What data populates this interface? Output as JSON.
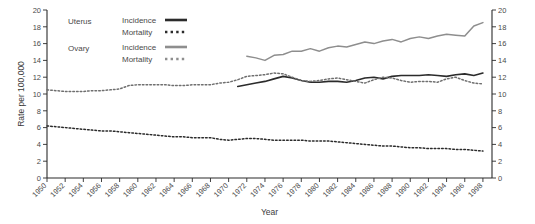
{
  "chart_data": {
    "type": "line",
    "title": "",
    "xlabel": "Year",
    "ylabel": "Rate per 100,000",
    "xlim": [
      1950,
      1999
    ],
    "ylim": [
      0,
      20
    ],
    "ytick_step": 2,
    "xtick_step": 2,
    "grid": false,
    "legend_position": "top-left-inside",
    "yticks": [
      "0",
      "2",
      "4",
      "6",
      "8",
      "10",
      "12",
      "14",
      "16",
      "18",
      "20"
    ],
    "right_axis_yticks": [
      "0",
      "2",
      "4",
      "6",
      "8",
      "10",
      "12",
      "14",
      "16",
      "18",
      "20"
    ],
    "xticks": [
      "1950",
      "1952",
      "1954",
      "1956",
      "1958",
      "1960",
      "1962",
      "1964",
      "1966",
      "1968",
      "1970",
      "1972",
      "1974",
      "1976",
      "1978",
      "1980",
      "1982",
      "1984",
      "1986",
      "1988",
      "1990",
      "1992",
      "1994",
      "1996",
      "1998"
    ],
    "legend": {
      "groups": [
        {
          "name": "Uterus",
          "color": "#2b2b2b",
          "entries": [
            {
              "label": "Incidence",
              "style": "solid"
            },
            {
              "label": "Mortality",
              "style": "dotted"
            }
          ]
        },
        {
          "name": "Ovary",
          "color": "#8e8e8e",
          "entries": [
            {
              "label": "Incidence",
              "style": "solid"
            },
            {
              "label": "Mortality",
              "style": "dotted"
            }
          ]
        }
      ]
    },
    "series": [
      {
        "name": "Uterus Incidence",
        "group": "Uterus",
        "style": "solid",
        "color": "#2b2b2b",
        "width": 1.6,
        "x": [
          1971,
          1972,
          1973,
          1974,
          1975,
          1976,
          1977,
          1978,
          1979,
          1980,
          1981,
          1982,
          1983,
          1984,
          1985,
          1986,
          1987,
          1988,
          1989,
          1990,
          1991,
          1992,
          1993,
          1994,
          1995,
          1996,
          1997,
          1998
        ],
        "values": [
          10.9,
          11.1,
          11.3,
          11.5,
          11.8,
          12.1,
          11.9,
          11.6,
          11.4,
          11.4,
          11.5,
          11.5,
          11.4,
          11.6,
          11.9,
          12.0,
          11.8,
          12.1,
          12.2,
          12.2,
          12.2,
          12.3,
          12.2,
          12.1,
          12.3,
          12.4,
          12.2,
          12.5
        ]
      },
      {
        "name": "Uterus Mortality",
        "group": "Uterus",
        "style": "dotted",
        "color": "#2b2b2b",
        "width": 1.5,
        "x": [
          1950,
          1951,
          1952,
          1953,
          1954,
          1955,
          1956,
          1957,
          1958,
          1959,
          1960,
          1961,
          1962,
          1963,
          1964,
          1965,
          1966,
          1967,
          1968,
          1969,
          1970,
          1971,
          1972,
          1973,
          1974,
          1975,
          1976,
          1977,
          1978,
          1979,
          1980,
          1981,
          1982,
          1983,
          1984,
          1985,
          1986,
          1987,
          1988,
          1989,
          1990,
          1991,
          1992,
          1993,
          1994,
          1995,
          1996,
          1997,
          1998
        ],
        "values": [
          6.2,
          6.1,
          6.0,
          5.9,
          5.8,
          5.7,
          5.6,
          5.6,
          5.5,
          5.4,
          5.3,
          5.2,
          5.1,
          5.0,
          4.9,
          4.9,
          4.8,
          4.8,
          4.8,
          4.6,
          4.5,
          4.6,
          4.7,
          4.7,
          4.6,
          4.5,
          4.5,
          4.5,
          4.5,
          4.4,
          4.4,
          4.4,
          4.3,
          4.2,
          4.1,
          4.0,
          3.9,
          3.8,
          3.8,
          3.7,
          3.6,
          3.6,
          3.5,
          3.5,
          3.5,
          3.4,
          3.4,
          3.3,
          3.2
        ]
      },
      {
        "name": "Ovary Incidence",
        "group": "Ovary",
        "style": "solid",
        "color": "#8e8e8e",
        "width": 1.5,
        "x": [
          1972,
          1973,
          1974,
          1975,
          1976,
          1977,
          1978,
          1979,
          1980,
          1981,
          1982,
          1983,
          1984,
          1985,
          1986,
          1987,
          1988,
          1989,
          1990,
          1991,
          1992,
          1993,
          1994,
          1995,
          1996,
          1997,
          1998
        ],
        "values": [
          14.5,
          14.3,
          14.0,
          14.6,
          14.7,
          15.1,
          15.1,
          15.4,
          15.1,
          15.5,
          15.7,
          15.6,
          15.9,
          16.2,
          16.0,
          16.3,
          16.5,
          16.2,
          16.6,
          16.8,
          16.6,
          16.9,
          17.1,
          17.0,
          16.9,
          18.1,
          18.5
        ]
      },
      {
        "name": "Ovary Mortality",
        "group": "Ovary",
        "style": "dotted",
        "color": "#6f6f6f",
        "width": 1.5,
        "x": [
          1950,
          1951,
          1952,
          1953,
          1954,
          1955,
          1956,
          1957,
          1958,
          1959,
          1960,
          1961,
          1962,
          1963,
          1964,
          1965,
          1966,
          1967,
          1968,
          1969,
          1970,
          1971,
          1972,
          1973,
          1974,
          1975,
          1976,
          1977,
          1978,
          1979,
          1980,
          1981,
          1982,
          1983,
          1984,
          1985,
          1986,
          1987,
          1988,
          1989,
          1990,
          1991,
          1992,
          1993,
          1994,
          1995,
          1996,
          1997,
          1998
        ],
        "values": [
          10.5,
          10.4,
          10.3,
          10.3,
          10.3,
          10.4,
          10.4,
          10.5,
          10.6,
          11.0,
          11.1,
          11.1,
          11.1,
          11.1,
          11.0,
          11.0,
          11.1,
          11.1,
          11.1,
          11.3,
          11.4,
          11.7,
          12.1,
          12.2,
          12.3,
          12.5,
          12.4,
          12.0,
          11.6,
          11.5,
          11.6,
          11.8,
          11.9,
          11.7,
          11.5,
          11.3,
          11.7,
          12.0,
          11.9,
          11.6,
          11.4,
          11.5,
          11.5,
          11.4,
          11.8,
          12.0,
          11.6,
          11.3,
          11.2
        ]
      }
    ]
  }
}
